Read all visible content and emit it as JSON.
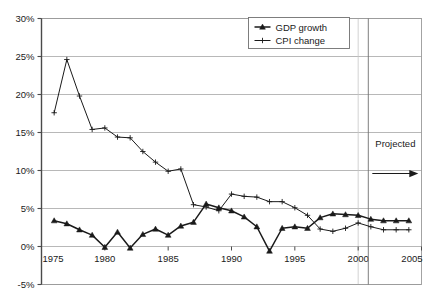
{
  "chart_data": {
    "type": "line",
    "title": "",
    "subtitle": "",
    "xlabel": "",
    "ylabel": "",
    "xlim": [
      1975,
      2005
    ],
    "ylim": [
      -5,
      30
    ],
    "grid": true,
    "legend_position": "top-center",
    "x_ticks": [
      "1975",
      "1980",
      "1985",
      "1990",
      "1995",
      "2000",
      "2005"
    ],
    "x_tick_values": [
      1975,
      1980,
      1985,
      1990,
      1995,
      2000,
      2005
    ],
    "y_ticks": [
      "-5%",
      "0%",
      "5%",
      "10%",
      "15%",
      "20%",
      "25%",
      "30%"
    ],
    "y_tick_values": [
      -5,
      0,
      5,
      10,
      15,
      20,
      25,
      30
    ],
    "series": [
      {
        "name": "GDP growth",
        "marker": "triangle",
        "color": "#1a1a1a",
        "x": [
          1976,
          1977,
          1978,
          1979,
          1980,
          1981,
          1982,
          1983,
          1984,
          1985,
          1986,
          1987,
          1988,
          1989,
          1990,
          1991,
          1992,
          1993,
          1994,
          1995,
          1996,
          1997,
          1998,
          1999,
          2000,
          2001,
          2002,
          2003,
          2004
        ],
        "values": [
          3.4,
          3.0,
          2.2,
          1.5,
          -0.1,
          1.9,
          -0.2,
          1.6,
          2.3,
          1.5,
          2.7,
          3.2,
          5.6,
          5.1,
          4.7,
          3.9,
          2.6,
          -0.6,
          2.4,
          2.6,
          2.4,
          3.8,
          4.3,
          4.2,
          4.1,
          3.6,
          3.4,
          3.4,
          3.4
        ]
      },
      {
        "name": "CPI change",
        "marker": "plus",
        "color": "#1a1a1a",
        "x": [
          1976,
          1977,
          1978,
          1979,
          1980,
          1981,
          1982,
          1983,
          1984,
          1985,
          1986,
          1987,
          1988,
          1989,
          1990,
          1991,
          1992,
          1993,
          1994,
          1995,
          1996,
          1997,
          1998,
          1999,
          2000,
          2001,
          2002,
          2003,
          2004
        ],
        "values": [
          17.6,
          24.6,
          19.8,
          15.4,
          15.6,
          14.4,
          14.3,
          12.5,
          11.1,
          9.9,
          10.2,
          5.5,
          5.2,
          4.7,
          6.9,
          6.6,
          6.5,
          5.9,
          5.9,
          5.1,
          4.1,
          2.3,
          2.0,
          2.4,
          3.1,
          2.6,
          2.2,
          2.2,
          2.2
        ]
      }
    ],
    "annotations": [
      {
        "name": "projected-divider",
        "label": "Projected",
        "x_value": 2000.8,
        "arrow": "right"
      }
    ]
  },
  "legend": {
    "entries": [
      {
        "label": "GDP growth",
        "marker": "triangle"
      },
      {
        "label": "CPI change",
        "marker": "plus"
      }
    ]
  }
}
